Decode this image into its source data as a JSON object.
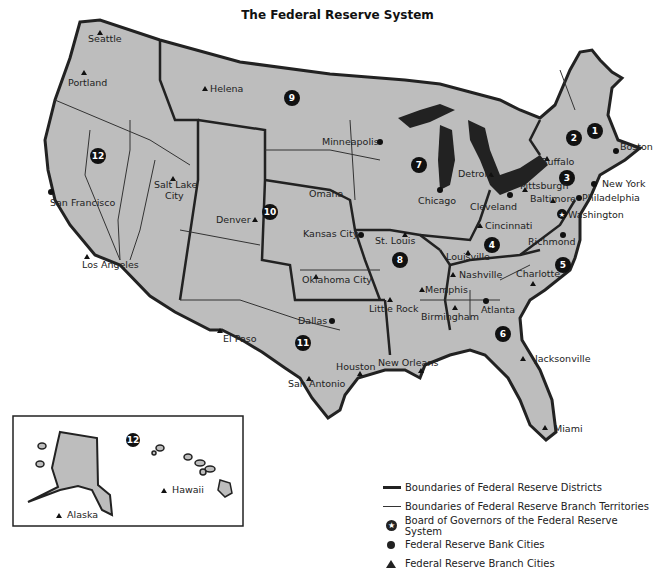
{
  "title": "The Federal Reserve System",
  "colors": {
    "land": "#bdbdbd",
    "border": "#222222",
    "water": "#ffffff",
    "marker": "#111111"
  },
  "districts": [
    {
      "number": "1",
      "label": "1"
    },
    {
      "number": "2",
      "label": "2"
    },
    {
      "number": "3",
      "label": "3"
    },
    {
      "number": "4",
      "label": "4"
    },
    {
      "number": "5",
      "label": "5"
    },
    {
      "number": "6",
      "label": "6"
    },
    {
      "number": "7",
      "label": "7"
    },
    {
      "number": "8",
      "label": "8"
    },
    {
      "number": "9",
      "label": "9"
    },
    {
      "number": "10",
      "label": "10"
    },
    {
      "number": "11",
      "label": "11"
    },
    {
      "number": "12",
      "label": "12"
    },
    {
      "number": "12",
      "label": "12"
    }
  ],
  "bank_cities": [
    "Boston",
    "New York",
    "Philadelphia",
    "Cleveland",
    "Richmond",
    "Atlanta",
    "Chicago",
    "St. Louis",
    "Minneapolis",
    "Kansas City",
    "Dallas",
    "San Francisco"
  ],
  "branch_cities": [
    "Buffalo",
    "Pittsburgh",
    "Baltimore",
    "Cincinnati",
    "Charlotte",
    "Jacksonville",
    "Miami",
    "Birmingham",
    "Nashville",
    "New Orleans",
    "Detroit",
    "Louisville",
    "Memphis",
    "Little Rock",
    "Helena",
    "Omaha",
    "Denver",
    "Oklahoma City",
    "El Paso",
    "Houston",
    "San Antonio",
    "Seattle",
    "Portland",
    "Salt Lake City",
    "Los Angeles",
    "Alaska",
    "Hawaii"
  ],
  "board": "Washington",
  "labels": {
    "seattle": "Seattle",
    "portland": "Portland",
    "helena": "Helena",
    "minneapolis": "Minneapolis",
    "boston": "Boston",
    "buffalo": "Buffalo",
    "newyork": "New York",
    "philadelphia": "Philadelphia",
    "pittsburgh": "Pittsburgh",
    "baltimore": "Baltimore",
    "washington": "Washington",
    "detroit": "Detroit",
    "chicago": "Chicago",
    "cleveland": "Cleveland",
    "cincinnati": "Cincinnati",
    "richmond": "Richmond",
    "louisville": "Louisville",
    "stlouis": "St. Louis",
    "omaha": "Omaha",
    "kansascity": "Kansas City",
    "saltlake1": "Salt Lake",
    "saltlake2": "City",
    "denver": "Denver",
    "sanfrancisco": "San Francisco",
    "losangeles": "Los Angeles",
    "oklahoma": "Oklahoma City",
    "nashville": "Nashville",
    "charlotte": "Charlotte",
    "memphis": "Memphis",
    "littlerock": "Little Rock",
    "birmingham": "Birmingham",
    "atlanta": "Atlanta",
    "dallas": "Dallas",
    "elpaso": "El Paso",
    "jacksonville": "Jacksonville",
    "houston": "Houston",
    "neworleans": "New Orleans",
    "sanantonio": "San Antonio",
    "miami": "Miami",
    "alaska": "Alaska",
    "hawaii": "Hawaii"
  },
  "legend": [
    {
      "symbol": "thick-line",
      "label": "Boundaries of Federal Reserve Districts"
    },
    {
      "symbol": "thin-line",
      "label": "Boundaries of Federal Reserve Branch Territories"
    },
    {
      "symbol": "star-circle",
      "label": "Board of Governors of the Federal Reserve System"
    },
    {
      "symbol": "dot",
      "label": "Federal Reserve Bank Cities"
    },
    {
      "symbol": "triangle",
      "label": "Federal Reserve Branch Cities"
    }
  ]
}
